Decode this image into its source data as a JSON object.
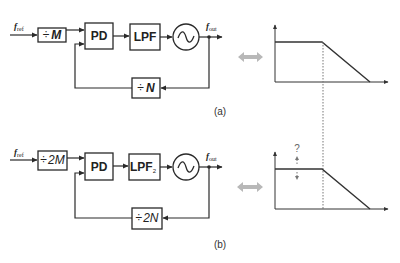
{
  "diagram_a": {
    "caption": "(a)",
    "input_signal": "f",
    "input_signal_sub": "ref",
    "output_signal": "f",
    "output_signal_sub": "out",
    "pre_divider": {
      "symbol": "÷",
      "value": "M"
    },
    "phase_detector": "PD",
    "loop_filter": {
      "name": "LPF",
      "sub": ""
    },
    "oscillator_icon": "sine-wave-icon",
    "feedback_divider": {
      "symbol": "÷",
      "value": "N"
    }
  },
  "diagram_b": {
    "caption": "(b)",
    "input_signal": "f",
    "input_signal_sub": "ref",
    "output_signal": "f",
    "output_signal_sub": "out",
    "pre_divider": {
      "symbol": "÷",
      "value": "2M"
    },
    "phase_detector": "PD",
    "loop_filter": {
      "name": "LPF",
      "sub": "2"
    },
    "oscillator_icon": "sine-wave-icon",
    "feedback_divider": {
      "symbol": "÷",
      "value": "2N"
    }
  },
  "response_a": {
    "type": "low-pass frequency response",
    "annotation": ""
  },
  "response_b": {
    "type": "low-pass frequency response",
    "annotation": "?"
  },
  "colors": {
    "line": "#2a2a2a",
    "equivalence_arrow": "#b0b0b0",
    "dotted_guide": "#777777"
  }
}
